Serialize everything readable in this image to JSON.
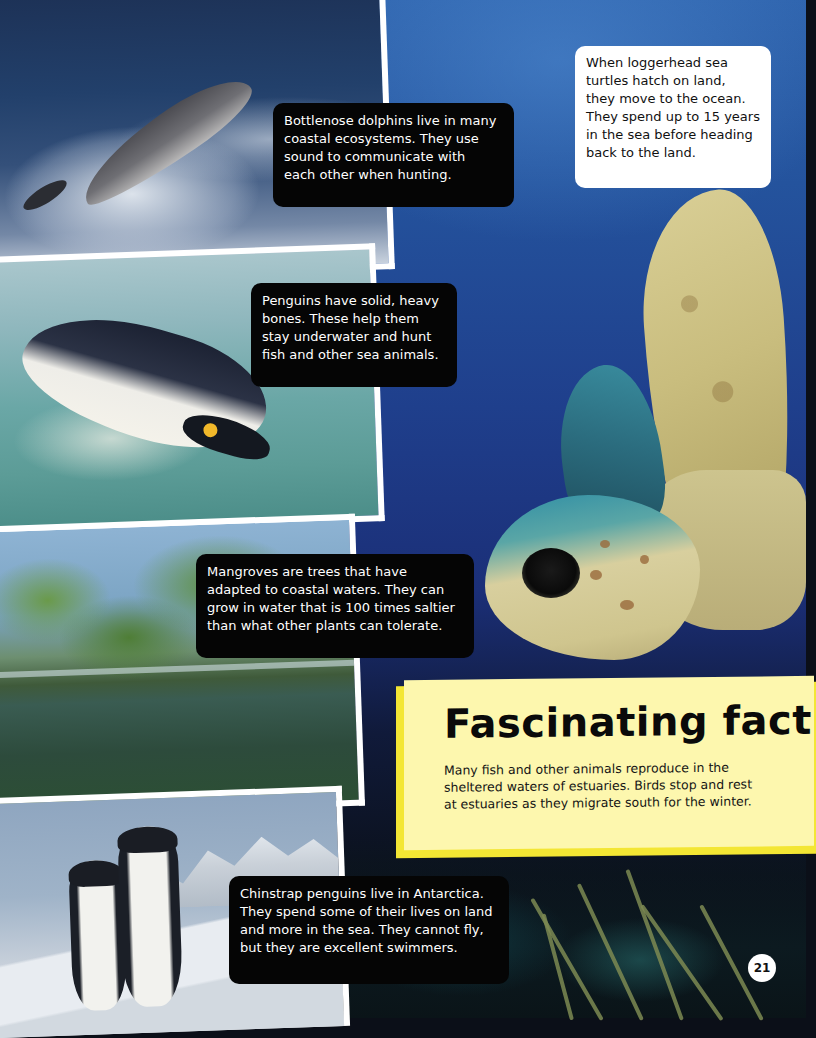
{
  "page": {
    "number": "21",
    "background_color": "#1f3f8c",
    "accent_yellow": "#fdf7ae",
    "accent_yellow_edge": "#f3e634"
  },
  "photos": [
    {
      "subject": "bottlenose-dolphin"
    },
    {
      "subject": "king-penguin-swimming"
    },
    {
      "subject": "mangroves"
    },
    {
      "subject": "chinstrap-penguins"
    },
    {
      "subject": "loggerhead-sea-turtle"
    }
  ],
  "captions": {
    "dolphin": {
      "lines": [
        "Bottlenose dolphins live in many",
        "coastal ecosystems. They use",
        "sound to communicate with",
        "each other when hunting."
      ]
    },
    "turtle": {
      "lines": [
        "When loggerhead sea",
        "turtles hatch on land,",
        "they move to the ocean.",
        "They spend up to 15 years",
        "in the sea before heading",
        "back to the land."
      ]
    },
    "penguin": {
      "lines": [
        "Penguins have solid, heavy",
        "bones. These help them",
        "stay underwater and hunt",
        "fish and other sea animals."
      ]
    },
    "mangrove": {
      "lines": [
        "Mangroves are trees that have",
        "adapted to coastal waters. They can",
        "grow in water that is 100 times saltier",
        "than what other plants can tolerate."
      ]
    },
    "chinstrap": {
      "lines": [
        "Chinstrap penguins live in Antarctica.",
        "They spend some of their lives on land",
        "and more in the sea. They cannot fly,",
        "but they are excellent swimmers."
      ]
    }
  },
  "fact_box": {
    "title": "Fascinating fact",
    "lines": [
      "Many fish and other animals reproduce in the",
      "sheltered waters of estuaries. Birds stop and rest",
      "at estuaries as they migrate south for the winter."
    ]
  }
}
